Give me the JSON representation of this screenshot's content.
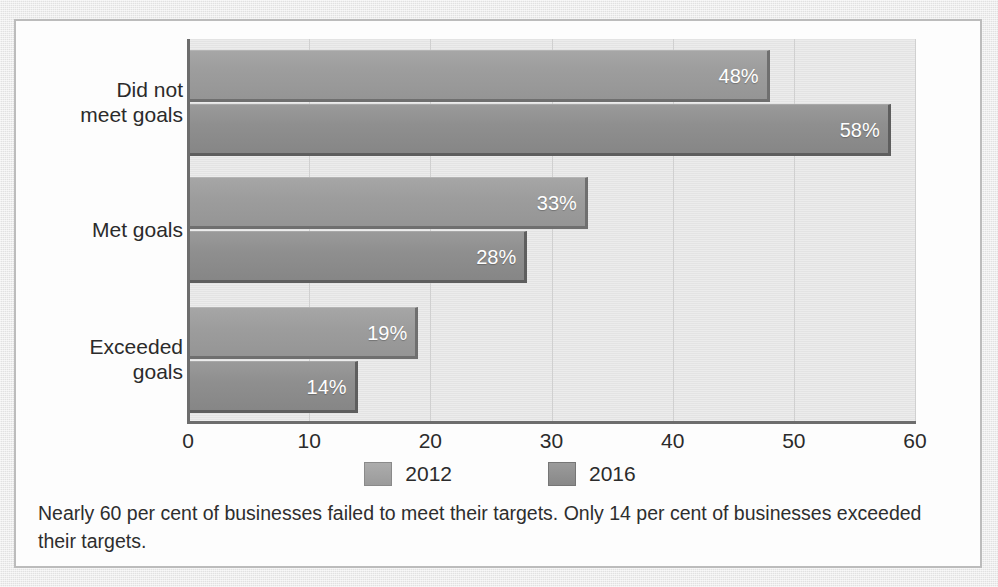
{
  "chart_data": {
    "type": "bar",
    "orientation": "horizontal",
    "title": "",
    "xlabel": "",
    "ylabel": "",
    "categories": [
      "Did not\nmeet goals",
      "Met goals",
      "Exceeded\ngoals"
    ],
    "series": [
      {
        "name": "2012",
        "values": [
          48,
          33,
          19
        ],
        "labels": [
          "48%",
          "33%",
          "19%"
        ],
        "color": "#9d9d9d"
      },
      {
        "name": "2016",
        "values": [
          58,
          28,
          14
        ],
        "labels": [
          "58%",
          "28%",
          "14%"
        ],
        "color": "#8f8f8f"
      }
    ],
    "xlim": [
      0,
      60
    ],
    "xticks": [
      0,
      10,
      20,
      30,
      40,
      50,
      60
    ],
    "xtick_labels": [
      "0",
      "10",
      "20",
      "30",
      "40",
      "50",
      "60"
    ],
    "grid": "vertical",
    "legend_position": "bottom-center",
    "value_label_unit": "%"
  },
  "legend": {
    "items": [
      {
        "label": "2012",
        "swatch": "legend-swatch-2012"
      },
      {
        "label": "2016",
        "swatch": "legend-swatch-2016"
      }
    ]
  },
  "caption": {
    "text": "Nearly 60 per cent of businesses failed to meet their targets. Only 14 per cent of businesses exceeded their targets."
  },
  "colors": {
    "page_background": "#e7e7e7",
    "figure_background": "#fdfdfd",
    "figure_border": "#bcbcbc",
    "plot_background": "#e6e6e6",
    "gridline": "#d0d0d0",
    "axis": "#6d6d6d",
    "series_2012": "#9d9d9d",
    "series_2016": "#8f8f8f",
    "bar_value_text": "#ffffff",
    "text": "#2b2b2b"
  }
}
